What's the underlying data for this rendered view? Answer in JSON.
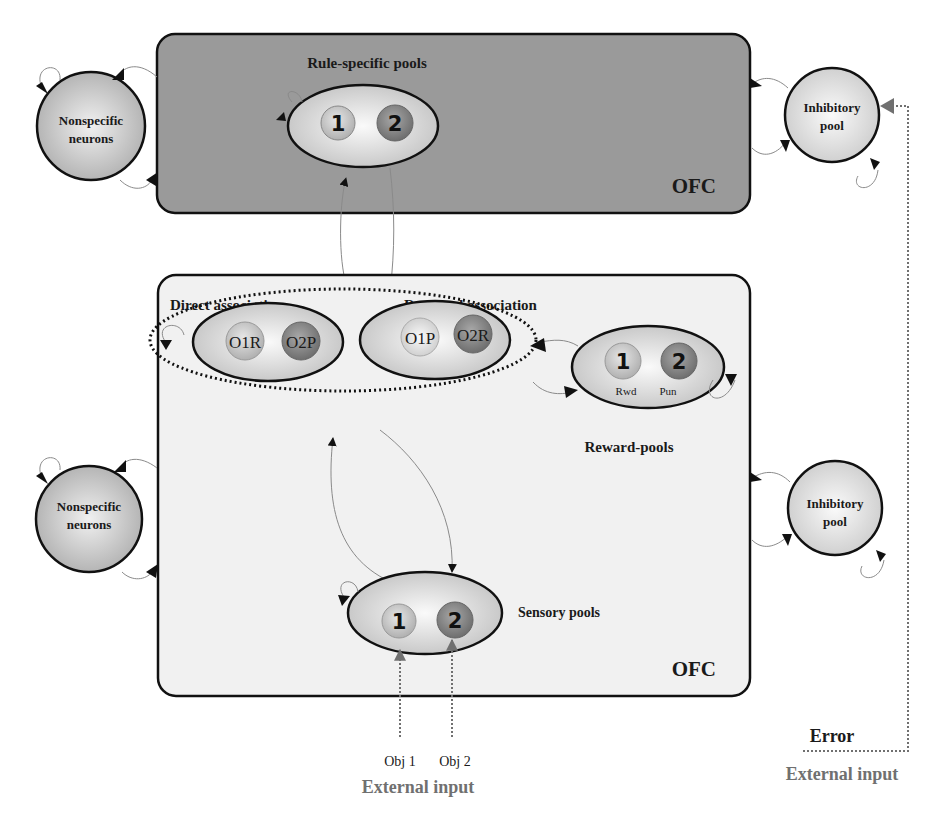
{
  "diagram": {
    "colors": {
      "upper_box_fill": "#9a9a9a",
      "lower_box_fill": "#f1f1f1",
      "stroke": "#111111",
      "thin_arrow": "#8a8a8a",
      "external_input_gray": "#707070",
      "pool_light": "#d6d6d6",
      "pool_dark": "#8c8c8c"
    },
    "upper_module": {
      "title": "Rule-specific pools",
      "region_label": "OFC",
      "pools": [
        {
          "id": "rule-1",
          "label": "1"
        },
        {
          "id": "rule-2",
          "label": "2"
        }
      ]
    },
    "lower_module": {
      "region_label": "OFC",
      "direct_association": {
        "title": "Direct association",
        "pools": [
          {
            "label": "O1R"
          },
          {
            "label": "O2P"
          }
        ]
      },
      "reversed_association": {
        "title": "Reversed  association",
        "pools": [
          {
            "label": "O1P"
          },
          {
            "label": "O2R"
          }
        ]
      },
      "reward_pools": {
        "title": "Reward-pools",
        "pools": [
          {
            "label": "1",
            "sublabel": "Rwd"
          },
          {
            "label": "2",
            "sublabel": "Pun"
          }
        ]
      },
      "sensory_pools": {
        "title": "Sensory pools",
        "pools": [
          {
            "label": "1"
          },
          {
            "label": "2"
          }
        ]
      }
    },
    "side_nodes": {
      "upper_nonspecific": {
        "line1": "Nonspecific",
        "line2": "neurons"
      },
      "upper_inhibitory": {
        "line1": "Inhibitory",
        "line2": "pool"
      },
      "lower_nonspecific": {
        "line1": "Nonspecific",
        "line2": "neurons"
      },
      "lower_inhibitory": {
        "line1": "Inhibitory",
        "line2": "pool"
      }
    },
    "inputs": {
      "obj1": "Obj 1",
      "obj2": "Obj 2",
      "sensory_external_label": "External input",
      "error_label": "Error",
      "error_external_label": "External input"
    }
  }
}
